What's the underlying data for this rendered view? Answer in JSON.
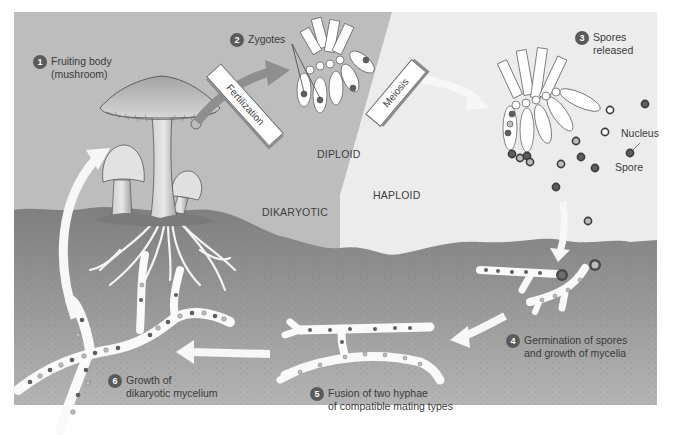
{
  "diagram": {
    "colors": {
      "background_diploid": "#b9b9b9",
      "background_haploid": "#ececec",
      "soil": "#9a9a9a",
      "soil_dark": "#7d7d7d",
      "arrow": "#f7f7f7",
      "fertilization_arrow": "#8f8f8f",
      "nucleus_dark": "#5e5e5e",
      "nucleus_light": "#b4b4b4",
      "badge": "#5a5a5a"
    },
    "steps": [
      {
        "number": "1",
        "line1": "Fruiting body",
        "line2": "(mushroom)"
      },
      {
        "number": "2",
        "line1": "Zygotes",
        "line2": ""
      },
      {
        "number": "3",
        "line1": "Spores",
        "line2": "released"
      },
      {
        "number": "4",
        "line1": "Germination of spores",
        "line2": "and growth of mycelia"
      },
      {
        "number": "5",
        "line1": "Fusion of two hyphae",
        "line2": "of compatible mating types"
      },
      {
        "number": "6",
        "line1": "Growth of",
        "line2": "dikaryotic mycelium"
      }
    ],
    "process_tags": {
      "fertilization": "Fertilization",
      "meiosis": "Meiosis"
    },
    "zones": {
      "diploid": "DIPLOID",
      "haploid": "HAPLOID",
      "dikaryotic": "DIKARYOTIC"
    },
    "callouts": {
      "nucleus": "Nucleus",
      "spore": "Spore"
    }
  }
}
